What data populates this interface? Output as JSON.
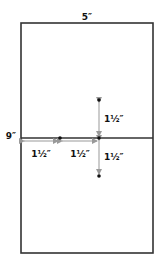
{
  "diagram": {
    "width_label": "5″",
    "height_label": "9″",
    "measurements": [
      {
        "id": "horizontal-left",
        "label": "1½″"
      },
      {
        "id": "horizontal-middle",
        "label": "1½″"
      },
      {
        "id": "vertical-up",
        "label": "1½″"
      },
      {
        "id": "vertical-down",
        "label": "1½″"
      }
    ],
    "colors": {
      "outline": "#333333",
      "arrow": "#999999",
      "dot": "#111111",
      "background": "#ffffff"
    }
  }
}
